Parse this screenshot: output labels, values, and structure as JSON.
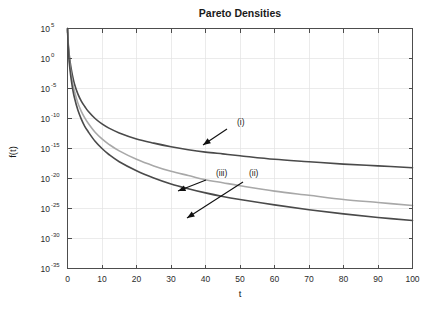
{
  "chart_data": {
    "type": "line",
    "title": "Pareto Densities",
    "xlabel": "t",
    "ylabel": "f(t)",
    "xlim": [
      0,
      100
    ],
    "ylim": [
      1e-35,
      100000.0
    ],
    "yscale": "log",
    "xscale": "linear",
    "grid": true,
    "legend_position": "none-inline-annotations",
    "xticks": [
      0,
      10,
      20,
      30,
      40,
      50,
      60,
      70,
      80,
      90,
      100
    ],
    "xtick_labels": [
      "0",
      "10",
      "20",
      "30",
      "40",
      "50",
      "60",
      "70",
      "80",
      "90",
      "100"
    ],
    "yticks": [
      100000.0,
      1.0,
      1e-05,
      1e-10,
      1e-15,
      1e-20,
      1e-25,
      1e-30,
      1e-35
    ],
    "ytick_labels": [
      {
        "mantissa": "10",
        "exponent": "5"
      },
      {
        "mantissa": "10",
        "exponent": "0"
      },
      {
        "mantissa": "10",
        "exponent": "-5"
      },
      {
        "mantissa": "10",
        "exponent": "-10"
      },
      {
        "mantissa": "10",
        "exponent": "-15"
      },
      {
        "mantissa": "10",
        "exponent": "-20"
      },
      {
        "mantissa": "10",
        "exponent": "-25"
      },
      {
        "mantissa": "10",
        "exponent": "-30"
      },
      {
        "mantissa": "10",
        "exponent": "-35"
      }
    ],
    "x": [
      0.05,
      0.1,
      0.2,
      0.3,
      0.5,
      0.75,
      1,
      1.5,
      2,
      3,
      4,
      5,
      6,
      8,
      10,
      12,
      15,
      20,
      25,
      30,
      35,
      40,
      45,
      50,
      60,
      70,
      80,
      90,
      100
    ],
    "series": [
      {
        "name": "(i)",
        "label": "(i)",
        "color": "#4a4a4a",
        "linewidth": 1.6,
        "log10_values": [
          4.6,
          3.9,
          2.6,
          1.9,
          0.6,
          -0.5,
          -1.5,
          -3.0,
          -4.2,
          -5.9,
          -7.1,
          -8.0,
          -8.8,
          -10.0,
          -10.9,
          -11.6,
          -12.4,
          -13.4,
          -14.1,
          -14.7,
          -15.2,
          -15.6,
          -15.9,
          -16.2,
          -16.8,
          -17.2,
          -17.6,
          -17.9,
          -18.2
        ],
        "description": "Heaviest tail Pareto density; slowest decay"
      },
      {
        "name": "(iii)",
        "label": "(iii)",
        "color": "#a8a8a8",
        "linewidth": 1.6,
        "log10_values": [
          4.4,
          3.6,
          2.2,
          1.4,
          0.0,
          -1.3,
          -2.4,
          -4.1,
          -5.4,
          -7.4,
          -8.8,
          -9.9,
          -10.8,
          -12.3,
          -13.4,
          -14.3,
          -15.4,
          -16.8,
          -17.9,
          -18.8,
          -19.5,
          -20.2,
          -20.7,
          -21.2,
          -22.1,
          -22.8,
          -23.5,
          -24.0,
          -24.5
        ],
        "description": "Intermediate tail Pareto density, light gray"
      },
      {
        "name": "(ii)",
        "label": "(ii)",
        "color": "#4a4a4a",
        "linewidth": 1.6,
        "log10_values": [
          4.3,
          3.4,
          1.9,
          1.0,
          -0.6,
          -2.0,
          -3.2,
          -5.1,
          -6.5,
          -8.6,
          -10.1,
          -11.3,
          -12.2,
          -13.8,
          -15.0,
          -16.0,
          -17.2,
          -18.7,
          -19.9,
          -20.9,
          -21.7,
          -22.4,
          -23.0,
          -23.5,
          -24.4,
          -25.2,
          -25.9,
          -26.5,
          -27.0
        ],
        "description": "Lightest tail Pareto density; fastest decay"
      }
    ],
    "annotations": [
      {
        "label": "(i)",
        "text_x": 100,
        "text_y": 1e-12,
        "points_to_series": "(i)",
        "points_to_x": 41,
        "points_to_y": 1e-15
      },
      {
        "label": "(iii)",
        "text_x": 100,
        "text_y": 1e-19,
        "points_to_series": "(iii)",
        "points_to_x": 29,
        "points_to_y": 1e-21
      },
      {
        "label": "(ii)",
        "text_x": 100,
        "text_y": 1e-19,
        "points_to_series": "(ii)",
        "points_to_x": 36,
        "points_to_y": 1e-26
      }
    ]
  },
  "figure": {
    "background_color": "#ffffff",
    "axes_color": "#4d4d4d",
    "grid_color": "#e2e2e2"
  }
}
